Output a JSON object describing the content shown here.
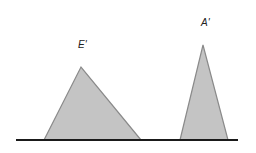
{
  "diagram": {
    "labels": {
      "left_triangle": "E'",
      "right_triangle": "A'"
    },
    "colors": {
      "fill": "#c4c4c4",
      "stroke": "#8a8a8a",
      "baseline": "#1a1a1a",
      "background": "#ffffff"
    },
    "baseline": {
      "x1": 16,
      "x2": 238,
      "y": 140
    },
    "shapes": [
      {
        "name": "E'",
        "points": [
          [
            44,
            140
          ],
          [
            81,
            67
          ],
          [
            141,
            140
          ]
        ]
      },
      {
        "name": "A'",
        "points": [
          [
            180,
            140
          ],
          [
            203,
            45
          ],
          [
            228,
            140
          ]
        ]
      }
    ]
  }
}
